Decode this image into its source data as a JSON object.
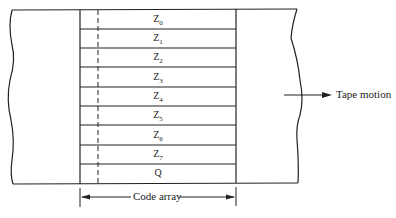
{
  "diagram": {
    "type": "tape-code-array",
    "rows": [
      {
        "label": "Z",
        "sub": "0"
      },
      {
        "label": "Z",
        "sub": "1"
      },
      {
        "label": "Z",
        "sub": "2"
      },
      {
        "label": "Z",
        "sub": "3"
      },
      {
        "label": "Z",
        "sub": "4"
      },
      {
        "label": "Z",
        "sub": "5"
      },
      {
        "label": "Z",
        "sub": "6"
      },
      {
        "label": "Z",
        "sub": "7"
      },
      {
        "label": "Q",
        "sub": ""
      }
    ],
    "tape_motion_label": "Tape motion",
    "code_array_label": "Code array",
    "line_color": "#222222"
  }
}
